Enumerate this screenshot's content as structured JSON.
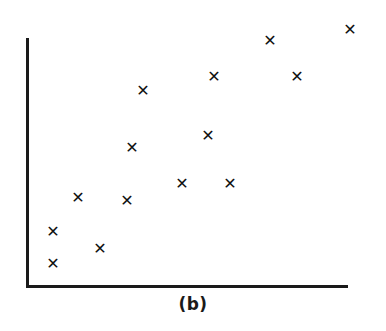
{
  "figure": {
    "caption": "(b)",
    "background_color": "#ffffff",
    "axis_color": "#1a1a1a",
    "marker_color": "#111111",
    "marker_glyph": "✕"
  },
  "chart_data": {
    "type": "scatter",
    "title": "",
    "subtitle": "",
    "caption": "(b)",
    "xlabel": "",
    "ylabel": "",
    "xlim": [
      0,
      100
    ],
    "ylim": [
      0,
      100
    ],
    "grid": false,
    "legend": null,
    "axes_style": "two-sided L-shaped spines, no tick marks, no tick labels",
    "series": [
      {
        "name": "observations",
        "marker": "x",
        "color": "#111111",
        "points": [
          {
            "x": 8.4,
            "y": 21.0
          },
          {
            "x": 8.4,
            "y": 8.0
          },
          {
            "x": 16.2,
            "y": 46.0
          },
          {
            "x": 23.0,
            "y": 14.0
          },
          {
            "x": 31.4,
            "y": 45.0
          },
          {
            "x": 33.2,
            "y": 55.0
          },
          {
            "x": 36.4,
            "y": 78.0
          },
          {
            "x": 48.4,
            "y": 52.0
          },
          {
            "x": 56.5,
            "y": 60.0
          },
          {
            "x": 58.4,
            "y": 52.0
          },
          {
            "x": 57.2,
            "y": 84.0
          },
          {
            "x": 75.8,
            "y": 98.0
          },
          {
            "x": 84.1,
            "y": 83.0
          },
          {
            "x": 100.0,
            "y": 103.0
          }
        ]
      }
    ],
    "pixel_points": [
      {
        "id": "p1",
        "px": 53,
        "py": 233
      },
      {
        "id": "p2",
        "px": 53,
        "py": 265
      },
      {
        "id": "p3",
        "px": 78,
        "py": 199
      },
      {
        "id": "p4",
        "px": 100,
        "py": 250
      },
      {
        "id": "p5",
        "px": 127,
        "py": 202
      },
      {
        "id": "p6",
        "px": 132,
        "py": 149
      },
      {
        "id": "p7",
        "px": 143,
        "py": 92
      },
      {
        "id": "p8",
        "px": 182,
        "py": 185
      },
      {
        "id": "p9",
        "px": 208,
        "py": 137
      },
      {
        "id": "p10",
        "px": 214,
        "py": 78
      },
      {
        "id": "p11",
        "px": 230,
        "py": 185
      },
      {
        "id": "p12",
        "px": 270,
        "py": 42
      },
      {
        "id": "p13",
        "px": 297,
        "py": 78
      },
      {
        "id": "p14",
        "px": 350,
        "py": 31
      }
    ]
  }
}
